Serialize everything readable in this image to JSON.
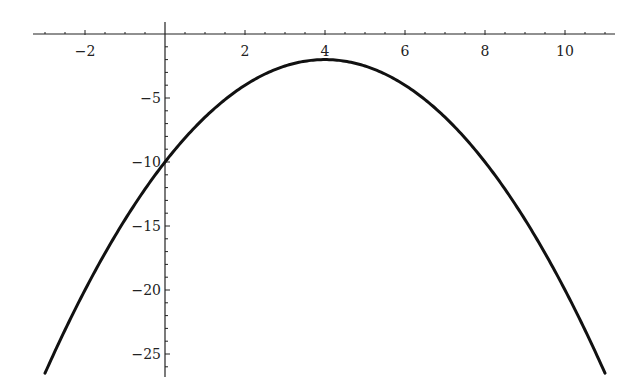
{
  "chart_data": {
    "type": "line",
    "title": "",
    "xlabel": "",
    "ylabel": "",
    "function": "y = -(x-4)^2/2 - 2",
    "xlim": [
      -3.3,
      11.25
    ],
    "ylim": [
      -26.8,
      0
    ],
    "x_ticks": [
      -2,
      2,
      4,
      6,
      8,
      10
    ],
    "x_tick_labels": [
      "-2",
      "2",
      "4",
      "6",
      "8",
      "10"
    ],
    "y_ticks": [
      -5,
      -10,
      -15,
      -20,
      -25
    ],
    "y_tick_labels": [
      "-5",
      "-10",
      "-15",
      "-20",
      "-25"
    ],
    "grid": false,
    "legend": null,
    "series": [
      {
        "name": "curve",
        "color": "#111111",
        "x": [
          -3,
          -2,
          -1,
          0,
          1,
          2,
          3,
          4,
          5,
          6,
          7,
          8,
          9,
          10,
          11
        ],
        "values": [
          -26.5,
          -20,
          -14.5,
          -10,
          -6.5,
          -4,
          -2.5,
          -2,
          -2.5,
          -4,
          -6.5,
          -10,
          -14.5,
          -20,
          -26.5
        ]
      }
    ]
  },
  "colors": {
    "background": "#ffffff",
    "axis": "#222222",
    "curve": "#111111"
  }
}
